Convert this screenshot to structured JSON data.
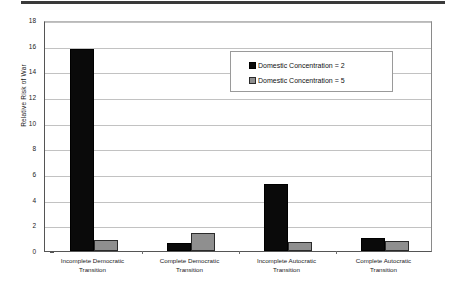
{
  "page": {
    "header_rule": "horizontal-rule"
  },
  "chart_data": {
    "type": "bar",
    "title": "",
    "xlabel": "",
    "ylabel": "Relative Risk of War",
    "ylim": [
      0,
      18
    ],
    "ytick_step": 2,
    "yticks": [
      "0",
      "2",
      "4",
      "6",
      "8",
      "10",
      "12",
      "14",
      "16",
      "18"
    ],
    "grid": true,
    "legend_position": "upper-right-inside",
    "categories": [
      "Incomplete Democratic Transition",
      "Complete Democratic Transition",
      "Incomplete Autocratic Transition",
      "Complete Autocratic Transition"
    ],
    "category_lines": [
      [
        "Incomplete Democratic",
        "Transition"
      ],
      [
        "Complete Democratic",
        "Transition"
      ],
      [
        "Incomplete Autocratic",
        "Transition"
      ],
      [
        "Complete Autocratic",
        "Transition"
      ]
    ],
    "series": [
      {
        "name": "Domestic Concentration = 2",
        "color": "#0a0a0a",
        "values": [
          15.75,
          0.62,
          5.2,
          1.02
        ]
      },
      {
        "name": "Domestic Concentration = 5",
        "color": "#8f8f8f",
        "values": [
          0.87,
          1.42,
          0.7,
          0.78
        ]
      }
    ]
  },
  "legend": {
    "items": [
      {
        "label": "Domestic Concentration = 2",
        "swatch": "black-square-swatch"
      },
      {
        "label": "Domestic Concentration = 5",
        "swatch": "gray-square-swatch"
      }
    ]
  }
}
